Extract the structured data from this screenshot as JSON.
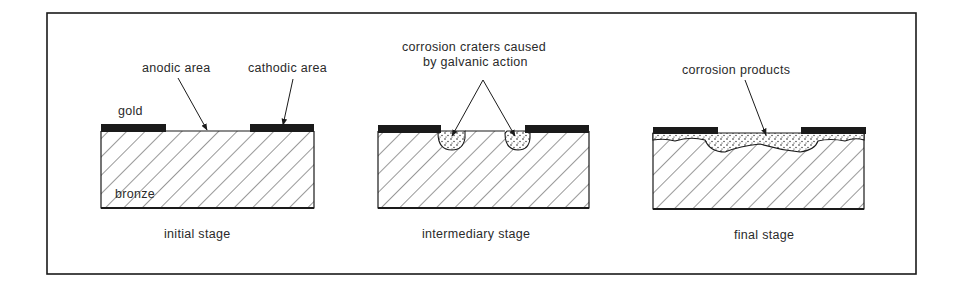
{
  "figure": {
    "panels": [
      {
        "id": "initial",
        "caption": "initial stage",
        "labels": {
          "anodic": "anodic area",
          "cathodic": "cathodic area",
          "gold": "gold",
          "bronze": "bronze"
        }
      },
      {
        "id": "intermediary",
        "caption": "intermediary stage",
        "labels": {
          "craters_line1": "corrosion craters caused",
          "craters_line2": "by galvanic action"
        }
      },
      {
        "id": "final",
        "caption": "final stage",
        "labels": {
          "products": "corrosion products"
        }
      }
    ],
    "colors": {
      "ink": "#1a1a1a",
      "paper": "#ffffff",
      "text": "#2a2a2a"
    }
  }
}
